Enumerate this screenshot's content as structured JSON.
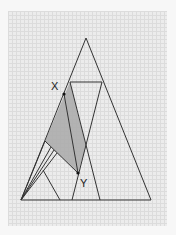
{
  "diagram": {
    "type": "geometric-construction",
    "labels": {
      "x": "X",
      "y": "Y"
    },
    "colors": {
      "paper": "#ececec",
      "grid": "#dcdcdc",
      "line": "#333333",
      "shade": "#a9a9a9"
    },
    "outer_triangle": {
      "apex": [
        86,
        38
      ],
      "bottom_left": [
        21,
        200
      ],
      "bottom_right": [
        151,
        200
      ]
    },
    "points": {
      "X": [
        64,
        94
      ],
      "Y": [
        78,
        173
      ]
    }
  }
}
